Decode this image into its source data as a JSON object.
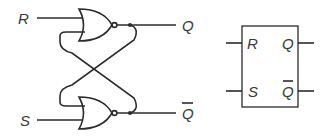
{
  "diagram": {
    "circuit": {
      "inputs": [
        {
          "id": "R",
          "label": "R"
        },
        {
          "id": "S",
          "label": "S"
        }
      ],
      "outputs": [
        {
          "id": "Q",
          "label": "Q"
        },
        {
          "id": "Qbar",
          "label": "Q",
          "overbar": true
        }
      ],
      "gates": [
        {
          "id": "nor-top",
          "type": "NOR",
          "inputs": [
            "R",
            "Qbar"
          ],
          "output": "Q"
        },
        {
          "id": "nor-bottom",
          "type": "NOR",
          "inputs": [
            "Q",
            "S"
          ],
          "output": "Qbar"
        }
      ],
      "connections": "cross-coupled feedback"
    },
    "symbol": {
      "left_pins": [
        {
          "label": "R"
        },
        {
          "label": "S"
        }
      ],
      "right_pins": [
        {
          "label": "Q"
        },
        {
          "label": "Q",
          "overbar": true
        }
      ]
    },
    "colors": {
      "line": "#2b2b2b",
      "text": "#3a3a3a",
      "background": "#ffffff"
    }
  }
}
